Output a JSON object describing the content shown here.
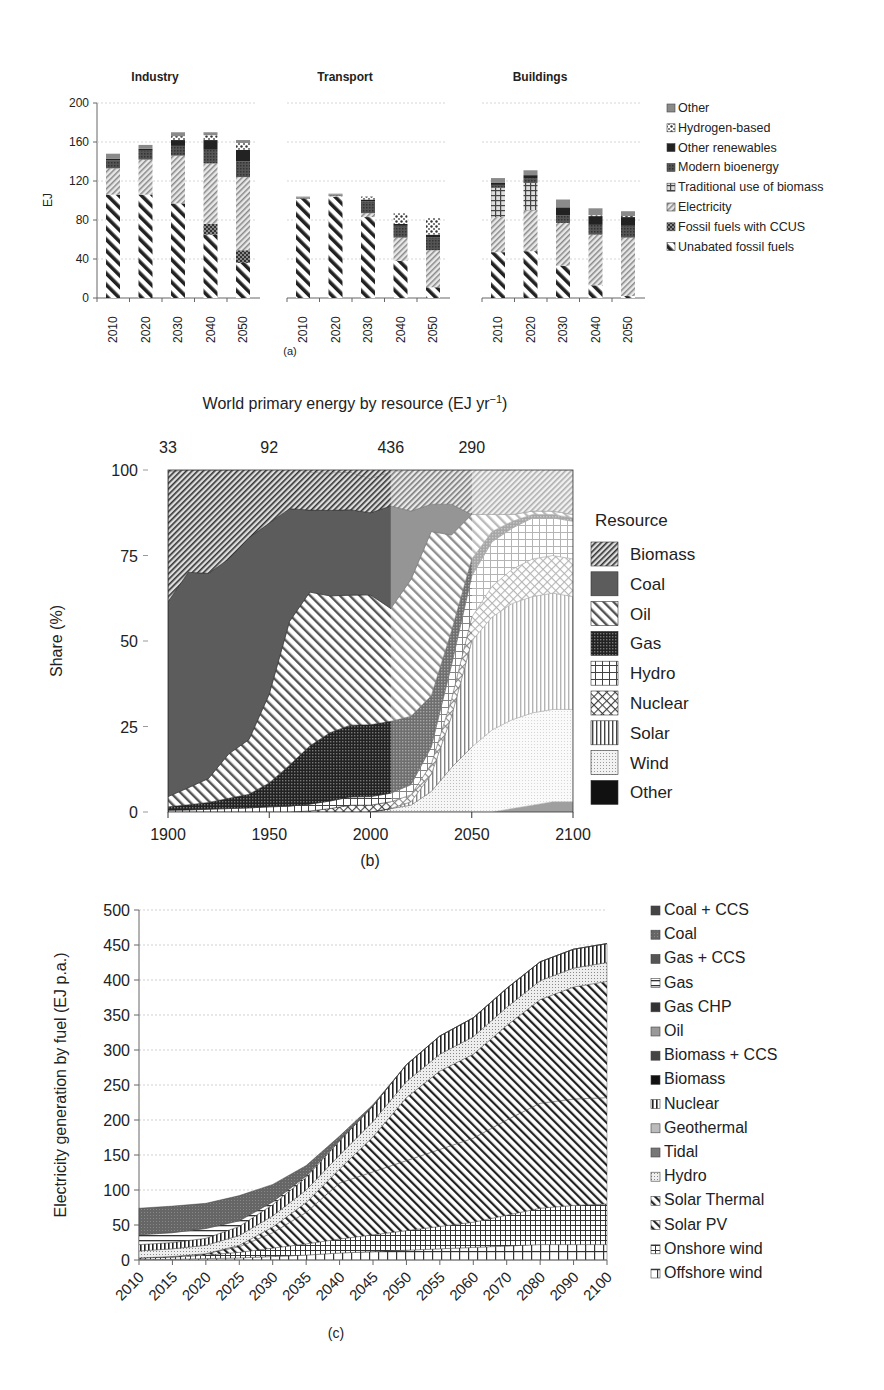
{
  "chart_data": [
    {
      "id": "a",
      "type": "bar",
      "stacked": true,
      "caption": "(a)",
      "ylabel": "EJ",
      "ylim": [
        0,
        200
      ],
      "yticks": [
        0,
        40,
        80,
        120,
        160,
        200
      ],
      "categories": [
        "2010",
        "2020",
        "2030",
        "2040",
        "2050"
      ],
      "legend": [
        "Other",
        "Hydrogen-based",
        "Other renewables",
        "Modern bioenergy",
        "Traditional use of biomass",
        "Electricity",
        "Fossil fuels with CCUS",
        "Unabated fossil fuels"
      ],
      "panels": [
        {
          "title": "Industry",
          "series": [
            {
              "name": "Unabated fossil fuels",
              "values": [
                106,
                106,
                97,
                65,
                36
              ]
            },
            {
              "name": "Fossil fuels with CCUS",
              "values": [
                0,
                0,
                0,
                11,
                13
              ]
            },
            {
              "name": "Electricity",
              "values": [
                27,
                36,
                49,
                62,
                75
              ]
            },
            {
              "name": "Traditional use of biomass",
              "values": [
                0,
                0,
                0,
                0,
                0
              ]
            },
            {
              "name": "Modern bioenergy",
              "values": [
                8,
                9,
                10,
                14,
                16
              ]
            },
            {
              "name": "Other renewables",
              "values": [
                2,
                2,
                6,
                10,
                12
              ]
            },
            {
              "name": "Hydrogen-based",
              "values": [
                0,
                0,
                4,
                5,
                7
              ]
            },
            {
              "name": "Other",
              "values": [
                5,
                4,
                4,
                3,
                3
              ]
            }
          ]
        },
        {
          "title": "Transport",
          "series": [
            {
              "name": "Unabated fossil fuels",
              "values": [
                102,
                104,
                83,
                38,
                11
              ]
            },
            {
              "name": "Fossil fuels with CCUS",
              "values": [
                0,
                0,
                0,
                0,
                0
              ]
            },
            {
              "name": "Electricity",
              "values": [
                0,
                1,
                4,
                24,
                38
              ]
            },
            {
              "name": "Traditional use of biomass",
              "values": [
                0,
                0,
                0,
                0,
                0
              ]
            },
            {
              "name": "Modern bioenergy",
              "values": [
                1,
                1,
                12,
                12,
                13
              ]
            },
            {
              "name": "Other renewables",
              "values": [
                0,
                0,
                2,
                2,
                3
              ]
            },
            {
              "name": "Hydrogen-based",
              "values": [
                0,
                0,
                3,
                11,
                17
              ]
            },
            {
              "name": "Other",
              "values": [
                1,
                1,
                0,
                0,
                0
              ]
            }
          ]
        },
        {
          "title": "Buildings",
          "series": [
            {
              "name": "Unabated fossil fuels",
              "values": [
                47,
                48,
                33,
                13,
                2
              ]
            },
            {
              "name": "Fossil fuels with CCUS",
              "values": [
                0,
                0,
                0,
                0,
                0
              ]
            },
            {
              "name": "Electricity",
              "values": [
                36,
                42,
                44,
                52,
                60
              ]
            },
            {
              "name": "Traditional use of biomass",
              "values": [
                30,
                28,
                0,
                0,
                0
              ]
            },
            {
              "name": "Modern bioenergy",
              "values": [
                3,
                5,
                8,
                10,
                12
              ]
            },
            {
              "name": "Other renewables",
              "values": [
                2,
                3,
                8,
                9,
                9
              ]
            },
            {
              "name": "Hydrogen-based",
              "values": [
                0,
                0,
                0,
                1,
                1
              ]
            },
            {
              "name": "Other",
              "values": [
                5,
                5,
                8,
                7,
                5
              ]
            }
          ]
        }
      ]
    },
    {
      "id": "b",
      "type": "area",
      "stacked": true,
      "caption": "(b)",
      "title": "World primary energy by resource (EJ yr⁻¹)",
      "totals_annotations": [
        {
          "year": 1900,
          "label": "33"
        },
        {
          "year": 1950,
          "label": "92"
        },
        {
          "year": 2010,
          "label": "436"
        },
        {
          "year": 2050,
          "label": "290"
        }
      ],
      "xlabel": "",
      "ylabel": "Share (%)",
      "xlim": [
        1900,
        2100
      ],
      "ylim": [
        0,
        100
      ],
      "xticks": [
        1900,
        1950,
        2000,
        2050,
        2100
      ],
      "yticks": [
        0,
        25,
        50,
        75,
        100
      ],
      "legend_title": "Resource",
      "legend": [
        "Biomass",
        "Coal",
        "Oil",
        "Gas",
        "Hydro",
        "Nuclear",
        "Solar",
        "Wind",
        "Other"
      ],
      "x": [
        1900,
        1910,
        1920,
        1930,
        1940,
        1950,
        1960,
        1970,
        1980,
        1990,
        2000,
        2010,
        2020,
        2030,
        2040,
        2050,
        2060,
        2070,
        2080,
        2090,
        2100
      ],
      "series": [
        {
          "name": "Other",
          "values": [
            0,
            0,
            0,
            0,
            0,
            0,
            0,
            0,
            0,
            0,
            0,
            0,
            0,
            0,
            0,
            0,
            0,
            1,
            2,
            3,
            3
          ]
        },
        {
          "name": "Wind",
          "values": [
            0,
            0,
            0,
            0,
            0,
            0,
            0,
            0,
            0,
            0,
            0,
            1,
            2,
            6,
            13,
            19,
            24,
            26,
            27,
            27,
            27
          ]
        },
        {
          "name": "Solar",
          "values": [
            0,
            0,
            0,
            0,
            0,
            0,
            0,
            0,
            0,
            0,
            0,
            0,
            1,
            5,
            15,
            31,
            33,
            34,
            34,
            34,
            33
          ]
        },
        {
          "name": "Nuclear",
          "values": [
            0,
            0,
            0,
            0,
            0,
            0,
            0,
            0.3,
            1,
            2,
            2,
            2,
            2,
            3,
            5,
            7,
            9,
            10,
            11,
            11,
            11
          ]
        },
        {
          "name": "Hydro",
          "values": [
            0.5,
            0.6,
            0.8,
            1,
            1.2,
            1.5,
            1.7,
            2,
            2.2,
            2.4,
            2.5,
            2.5,
            3,
            5,
            10,
            12,
            13,
            12,
            12,
            11,
            11
          ]
        },
        {
          "name": "Gas",
          "values": [
            1,
            1.5,
            2,
            3,
            4,
            7,
            12,
            17,
            20,
            21,
            21,
            21,
            20,
            15,
            10,
            5,
            3,
            2,
            1,
            1,
            1
          ]
        },
        {
          "name": "Oil",
          "values": [
            3,
            5,
            7,
            13,
            16,
            26,
            42,
            45,
            40,
            38,
            38,
            33,
            40,
            48,
            28,
            13,
            5,
            2,
            1,
            1,
            1
          ]
        },
        {
          "name": "Coal",
          "values": [
            57,
            63,
            60,
            57,
            59,
            50,
            33,
            24,
            25,
            25,
            24,
            30,
            20,
            8,
            9,
            0,
            0,
            0,
            0,
            0,
            0
          ]
        },
        {
          "name": "Biomass",
          "values": [
            38,
            30,
            30,
            26,
            20,
            16,
            12,
            11,
            11,
            11,
            10,
            10,
            12,
            10,
            10,
            13,
            13,
            13,
            13,
            12,
            13
          ]
        }
      ],
      "shaded_regions": [
        {
          "from": 2010,
          "to": 2050,
          "style": "medium-fade"
        },
        {
          "from": 2050,
          "to": 2100,
          "style": "light-fade"
        }
      ]
    },
    {
      "id": "c",
      "type": "area",
      "stacked": true,
      "caption": "(c)",
      "ylabel": "Electricity generation by fuel (EJ p.a.)",
      "ylim": [
        0,
        500
      ],
      "yticks": [
        0,
        50,
        100,
        150,
        200,
        250,
        300,
        350,
        400,
        450,
        500
      ],
      "categories": [
        "2010",
        "2015",
        "2020",
        "2025",
        "2030",
        "2035",
        "2040",
        "2045",
        "2050",
        "2055",
        "2060",
        "2070",
        "2080",
        "2090",
        "2100"
      ],
      "legend": [
        "Coal + CCS",
        "Coal",
        "Gas + CCS",
        "Gas",
        "Gas CHP",
        "Oil",
        "Biomass + CCS",
        "Biomass",
        "Nuclear",
        "Geothermal",
        "Tidal",
        "Hydro",
        "Solar Thermal",
        "Solar PV",
        "Onshore wind",
        "Offshore wind"
      ],
      "series": [
        {
          "name": "Offshore wind",
          "values": [
            1,
            1,
            2,
            3,
            5,
            7,
            10,
            12,
            14,
            16,
            18,
            20,
            22,
            22,
            22
          ]
        },
        {
          "name": "Onshore wind",
          "values": [
            2,
            3,
            5,
            8,
            12,
            16,
            20,
            24,
            28,
            32,
            36,
            44,
            52,
            56,
            58
          ]
        },
        {
          "name": "Solar PV",
          "values": [
            0,
            1,
            2,
            8,
            22,
            45,
            80,
            90,
            100,
            110,
            120,
            136,
            150,
            152,
            152
          ]
        },
        {
          "name": "Solar Thermal",
          "values": [
            0,
            0,
            0,
            2,
            8,
            14,
            20,
            50,
            90,
            112,
            120,
            135,
            148,
            160,
            166
          ]
        },
        {
          "name": "Hydro",
          "values": [
            10,
            11,
            12,
            14,
            16,
            18,
            20,
            22,
            23,
            24,
            25,
            26,
            27,
            27,
            27
          ]
        },
        {
          "name": "Nuclear",
          "values": [
            9,
            9,
            10,
            13,
            16,
            18,
            20,
            22,
            24,
            26,
            27,
            27,
            27,
            27,
            27
          ]
        },
        {
          "name": "Gas",
          "values": [
            14,
            14,
            14,
            8,
            4,
            2,
            1,
            0,
            0,
            0,
            0,
            0,
            0,
            0,
            0
          ]
        },
        {
          "name": "Coal",
          "values": [
            38,
            38,
            36,
            36,
            25,
            15,
            6,
            2,
            0,
            0,
            0,
            0,
            0,
            0,
            0
          ]
        },
        {
          "name": "Coal + CCS",
          "values": [
            0,
            0,
            0,
            0,
            0,
            0,
            0,
            0,
            0,
            0,
            0,
            0,
            0,
            0,
            0
          ]
        },
        {
          "name": "Gas + CCS",
          "values": [
            0,
            0,
            0,
            0,
            0,
            0,
            0,
            0,
            0,
            0,
            0,
            0,
            0,
            0,
            0
          ]
        },
        {
          "name": "Gas CHP",
          "values": [
            0,
            0,
            0,
            0,
            0,
            0,
            0,
            0,
            0,
            0,
            0,
            0,
            0,
            0,
            0
          ]
        },
        {
          "name": "Oil",
          "values": [
            0,
            0,
            0,
            0,
            0,
            0,
            0,
            0,
            0,
            0,
            0,
            0,
            0,
            0,
            0
          ]
        },
        {
          "name": "Biomass + CCS",
          "values": [
            0,
            0,
            0,
            0,
            0,
            0,
            0,
            0,
            0,
            0,
            0,
            0,
            0,
            0,
            0
          ]
        },
        {
          "name": "Biomass",
          "values": [
            0,
            0,
            0,
            0,
            0,
            0,
            0,
            0,
            0,
            0,
            0,
            0,
            0,
            0,
            0
          ]
        },
        {
          "name": "Geothermal",
          "values": [
            0,
            0,
            0,
            0,
            0,
            0,
            0,
            0,
            0,
            0,
            0,
            0,
            0,
            0,
            0
          ]
        },
        {
          "name": "Tidal",
          "values": [
            0,
            0,
            0,
            0,
            0,
            0,
            0,
            0,
            0,
            0,
            0,
            0,
            0,
            0,
            0
          ]
        }
      ]
    }
  ],
  "figure": {
    "caption_fragment": "... (a) ... 2050 ... 2100 in the ... scenario"
  }
}
